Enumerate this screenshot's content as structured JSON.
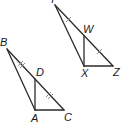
{
  "figure": {
    "triangles": [
      {
        "name": "upper",
        "vertices": [
          "Y",
          "X",
          "Z"
        ],
        "interior_point": "W",
        "segments": [
          "YX",
          "YZ",
          "XZ",
          "WX"
        ],
        "tick_marks": {
          "count_per_segment": 1,
          "segments": [
            "YW",
            "WZ"
          ]
        }
      },
      {
        "name": "lower",
        "vertices": [
          "B",
          "A",
          "C"
        ],
        "interior_point": "D",
        "segments": [
          "BA",
          "BC",
          "AC",
          "DA"
        ],
        "tick_marks": {
          "count_per_segment": 2,
          "segments": [
            "BD",
            "DC"
          ]
        }
      }
    ],
    "labels": {
      "Y": "Y",
      "W": "W",
      "X": "X",
      "Z": "Z",
      "B": "B",
      "D": "D",
      "A": "A",
      "C": "C"
    }
  }
}
